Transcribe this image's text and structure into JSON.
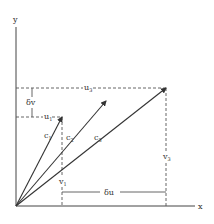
{
  "diagram": {
    "type": "vector-diagram",
    "colors": {
      "ink": "#333333",
      "background": "#ffffff"
    },
    "origin": {
      "x": 16,
      "y": 206
    },
    "axes": {
      "x": {
        "label": "x",
        "end": {
          "x": 195,
          "y": 206
        }
      },
      "y": {
        "label": "y",
        "end": {
          "x": 16,
          "y": 26
        }
      }
    },
    "vectors": [
      {
        "name": "c1",
        "label": "c",
        "subscript": "1",
        "tip": {
          "x": 62,
          "y": 117
        },
        "label_pos": {
          "x": 44,
          "y": 138
        }
      },
      {
        "name": "c2",
        "label": "c",
        "subscript": "2",
        "tip": {
          "x": 106,
          "y": 101
        },
        "label_pos": {
          "x": 66,
          "y": 140
        }
      },
      {
        "name": "c3",
        "label": "c",
        "subscript": "3",
        "tip": {
          "x": 166,
          "y": 88
        },
        "label_pos": {
          "x": 94,
          "y": 140
        }
      }
    ],
    "components": {
      "u1": {
        "label": "u",
        "subscript": "1"
      },
      "u3": {
        "label": "u",
        "subscript": "3"
      },
      "v1": {
        "label": "v",
        "subscript": "1"
      },
      "v3": {
        "label": "v",
        "subscript": "3"
      },
      "delta_u": {
        "label": "δu"
      },
      "delta_v": {
        "label": "δv"
      }
    }
  }
}
